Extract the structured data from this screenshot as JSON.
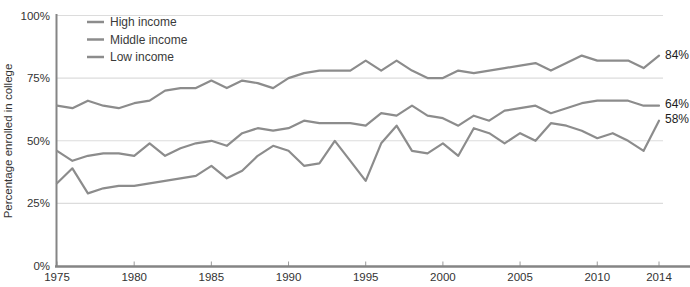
{
  "figure": {
    "y_axis_title": "Percentage enrolled in college",
    "legend": [
      {
        "label": "High income"
      },
      {
        "label": "Middle income"
      },
      {
        "label": "Low income"
      }
    ],
    "end_labels": [
      {
        "text": "84%",
        "series": "High income"
      },
      {
        "text": "64%",
        "series": "Middle income"
      },
      {
        "text": "58%",
        "series": "Low income"
      }
    ]
  },
  "colors": {
    "background": "#ffffff",
    "series_line": "#8c8c8c",
    "gridline": "#dcdcdc",
    "axis_spine": "#858585",
    "tick_mark": "#9a9a9a",
    "tick_text": "#333333",
    "end_label_text": "#1c1c1c"
  },
  "chart_data": {
    "type": "line",
    "title": "",
    "xlabel": "",
    "ylabel": "Percentage enrolled in college",
    "xlim": [
      1975,
      2014
    ],
    "ylim": [
      0,
      100
    ],
    "grid": "horizontal",
    "legend_position": "top-left-inside",
    "x_ticks": [
      {
        "label": "1975",
        "value": 1975
      },
      {
        "label": "1980",
        "value": 1980
      },
      {
        "label": "1985",
        "value": 1985
      },
      {
        "label": "1990",
        "value": 1990
      },
      {
        "label": "1995",
        "value": 1995
      },
      {
        "label": "2000",
        "value": 2000
      },
      {
        "label": "2005",
        "value": 2005
      },
      {
        "label": "2010",
        "value": 2010
      },
      {
        "label": "2014",
        "value": 2014
      }
    ],
    "y_ticks": [
      {
        "label": "0%",
        "value": 0
      },
      {
        "label": "25%",
        "value": 25
      },
      {
        "label": "50%",
        "value": 50
      },
      {
        "label": "75%",
        "value": 75
      },
      {
        "label": "100%",
        "value": 100
      }
    ],
    "x": [
      1975,
      1976,
      1977,
      1978,
      1979,
      1980,
      1981,
      1982,
      1983,
      1984,
      1985,
      1986,
      1987,
      1988,
      1989,
      1990,
      1991,
      1992,
      1993,
      1994,
      1995,
      1996,
      1997,
      1998,
      1999,
      2000,
      2001,
      2002,
      2003,
      2004,
      2005,
      2006,
      2007,
      2008,
      2009,
      2010,
      2011,
      2012,
      2013,
      2014
    ],
    "series": [
      {
        "name": "High income",
        "end_label": "84%",
        "values": [
          64,
          63,
          66,
          64,
          63,
          65,
          66,
          70,
          71,
          71,
          74,
          71,
          74,
          73,
          71,
          75,
          77,
          78,
          78,
          78,
          82,
          78,
          82,
          78,
          75,
          75,
          78,
          77,
          78,
          79,
          80,
          81,
          78,
          81,
          84,
          82,
          82,
          82,
          79,
          84
        ]
      },
      {
        "name": "Middle income",
        "end_label": "64%",
        "values": [
          46,
          42,
          44,
          45,
          45,
          44,
          49,
          44,
          47,
          49,
          50,
          48,
          53,
          55,
          54,
          55,
          58,
          57,
          57,
          57,
          56,
          61,
          60,
          64,
          60,
          59,
          56,
          60,
          58,
          62,
          63,
          64,
          61,
          63,
          65,
          66,
          66,
          66,
          64,
          64
        ]
      },
      {
        "name": "Low income",
        "end_label": "58%",
        "values": [
          33,
          39,
          29,
          31,
          32,
          32,
          33,
          34,
          35,
          36,
          40,
          35,
          38,
          44,
          48,
          46,
          40,
          41,
          50,
          42,
          34,
          49,
          56,
          46,
          45,
          49,
          44,
          55,
          53,
          49,
          53,
          50,
          57,
          56,
          54,
          51,
          53,
          50,
          46,
          58
        ]
      }
    ]
  }
}
